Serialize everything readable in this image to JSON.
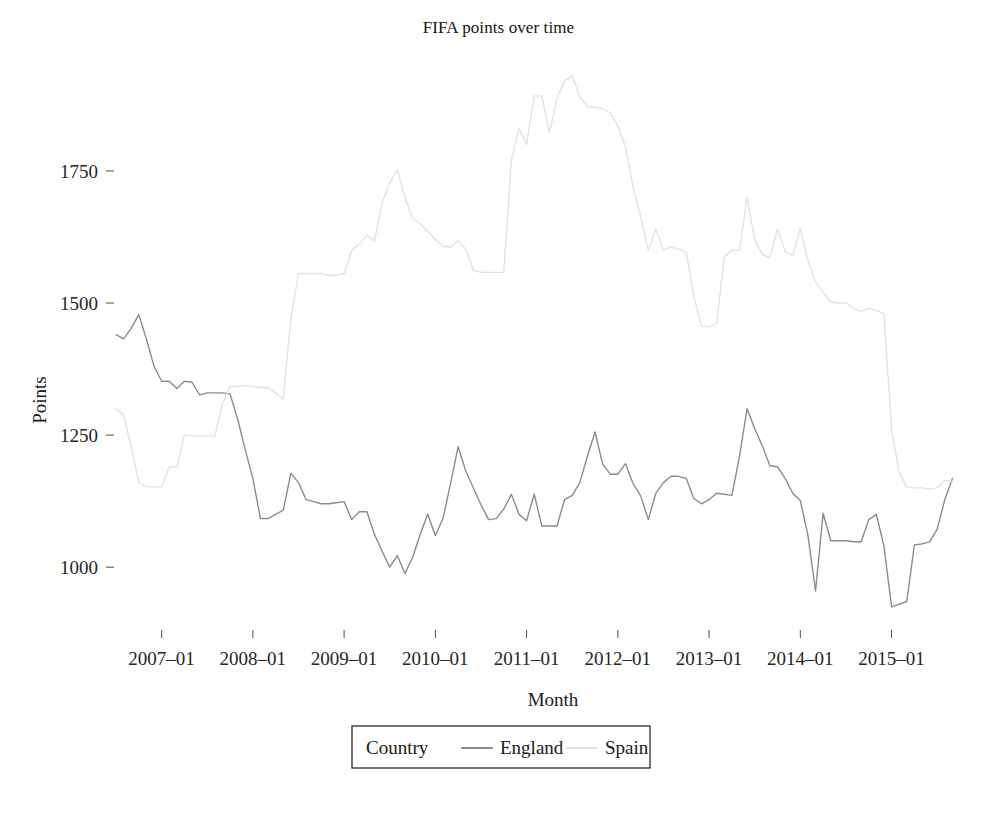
{
  "chart_data": {
    "type": "line",
    "title": "FIFA points over time",
    "xlabel": "Month",
    "ylabel": "Points",
    "grid": false,
    "legend_position": "bottom",
    "legend_title": "Country",
    "xlim": [
      "2006-07",
      "2015-10"
    ],
    "ylim": [
      900,
      1960
    ],
    "yticks": [
      1000,
      1250,
      1500,
      1750
    ],
    "ytick_labels": [
      "1000",
      "1250",
      "1500",
      "1750"
    ],
    "xticks": [
      "2007-01",
      "2008-01",
      "2009-01",
      "2010-01",
      "2011-01",
      "2012-01",
      "2013-01",
      "2014-01",
      "2015-01"
    ],
    "xtick_labels": [
      "2007–01",
      "2008–01",
      "2009–01",
      "2010–01",
      "2011–01",
      "2012–01",
      "2013–01",
      "2014–01",
      "2015–01"
    ],
    "colors": {
      "England": "#8c8c8c",
      "Spain": "#e2e2e2"
    },
    "x": [
      "2006-07",
      "2006-08",
      "2006-09",
      "2006-10",
      "2006-11",
      "2006-12",
      "2007-01",
      "2007-02",
      "2007-03",
      "2007-04",
      "2007-05",
      "2007-06",
      "2007-07",
      "2007-08",
      "2007-09",
      "2007-10",
      "2007-11",
      "2007-12",
      "2008-01",
      "2008-02",
      "2008-03",
      "2008-04",
      "2008-05",
      "2008-06",
      "2008-07",
      "2008-08",
      "2008-09",
      "2008-10",
      "2008-11",
      "2008-12",
      "2009-01",
      "2009-02",
      "2009-03",
      "2009-04",
      "2009-05",
      "2009-06",
      "2009-07",
      "2009-08",
      "2009-09",
      "2009-10",
      "2009-11",
      "2009-12",
      "2010-01",
      "2010-02",
      "2010-03",
      "2010-04",
      "2010-05",
      "2010-06",
      "2010-07",
      "2010-08",
      "2010-09",
      "2010-10",
      "2010-11",
      "2010-12",
      "2011-01",
      "2011-02",
      "2011-03",
      "2011-04",
      "2011-05",
      "2011-06",
      "2011-07",
      "2011-08",
      "2011-09",
      "2011-10",
      "2011-11",
      "2011-12",
      "2012-01",
      "2012-02",
      "2012-03",
      "2012-04",
      "2012-05",
      "2012-06",
      "2012-07",
      "2012-08",
      "2012-09",
      "2012-10",
      "2012-11",
      "2012-12",
      "2013-01",
      "2013-02",
      "2013-03",
      "2013-04",
      "2013-05",
      "2013-06",
      "2013-07",
      "2013-08",
      "2013-09",
      "2013-10",
      "2013-11",
      "2013-12",
      "2014-01",
      "2014-02",
      "2014-03",
      "2014-04",
      "2014-05",
      "2014-06",
      "2014-07",
      "2014-08",
      "2014-09",
      "2014-10",
      "2014-11",
      "2014-12",
      "2015-01",
      "2015-02",
      "2015-03",
      "2015-04",
      "2015-05",
      "2015-06",
      "2015-07",
      "2015-08",
      "2015-09"
    ],
    "series": [
      {
        "name": "England",
        "color": "#8c8c8c",
        "values": [
          1440,
          1432,
          1452,
          1478,
          1432,
          1380,
          1352,
          1352,
          1338,
          1352,
          1350,
          1326,
          1330,
          1330,
          1330,
          1328,
          1280,
          1222,
          1168,
          1092,
          1092,
          1100,
          1108,
          1178,
          1160,
          1128,
          1124,
          1120,
          1120,
          1122,
          1124,
          1090,
          1105,
          1105,
          1062,
          1030,
          1000,
          1022,
          988,
          1018,
          1062,
          1100,
          1060,
          1092,
          1158,
          1228,
          1182,
          1150,
          1118,
          1090,
          1092,
          1110,
          1138,
          1100,
          1088,
          1138,
          1078,
          1078,
          1078,
          1128,
          1136,
          1160,
          1210,
          1256,
          1195,
          1176,
          1176,
          1196,
          1158,
          1135,
          1090,
          1140,
          1160,
          1172,
          1172,
          1168,
          1130,
          1120,
          1128,
          1140,
          1138,
          1136,
          1210,
          1300,
          1262,
          1230,
          1192,
          1190,
          1168,
          1140,
          1126,
          1060,
          955,
          1102,
          1050,
          1050,
          1050,
          1048,
          1048,
          1090,
          1100,
          1040,
          925,
          930,
          935,
          1042,
          1044,
          1048,
          1072,
          1128,
          1168
        ]
      },
      {
        "name": "Spain",
        "color": "#e2e2e2",
        "values": [
          1300,
          1288,
          1228,
          1160,
          1152,
          1152,
          1152,
          1190,
          1190,
          1250,
          1248,
          1248,
          1248,
          1248,
          1310,
          1342,
          1342,
          1344,
          1342,
          1340,
          1340,
          1330,
          1318,
          1470,
          1556,
          1556,
          1556,
          1556,
          1552,
          1552,
          1556,
          1600,
          1612,
          1628,
          1618,
          1690,
          1728,
          1752,
          1700,
          1660,
          1650,
          1636,
          1620,
          1608,
          1606,
          1618,
          1602,
          1562,
          1558,
          1558,
          1558,
          1558,
          1770,
          1830,
          1800,
          1892,
          1892,
          1822,
          1888,
          1920,
          1930,
          1890,
          1872,
          1870,
          1868,
          1860,
          1836,
          1796,
          1720,
          1664,
          1600,
          1640,
          1600,
          1606,
          1602,
          1596,
          1512,
          1456,
          1455,
          1462,
          1588,
          1600,
          1600,
          1700,
          1620,
          1592,
          1586,
          1640,
          1598,
          1590,
          1640,
          1580,
          1540,
          1520,
          1502,
          1500,
          1500,
          1490,
          1484,
          1490,
          1486,
          1480,
          1260,
          1180,
          1152,
          1150,
          1150,
          1148,
          1150,
          1164,
          1162
        ]
      }
    ]
  }
}
